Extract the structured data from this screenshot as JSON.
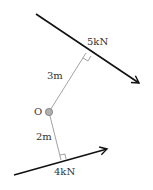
{
  "diagram": {
    "pivot": {
      "label": "O"
    },
    "forces": [
      {
        "id": "upper",
        "label": "5kN",
        "magnitude_kN": 5,
        "perpendicular_distance_label": "3m",
        "perpendicular_distance_m": 3
      },
      {
        "id": "lower",
        "label": "4kN",
        "magnitude_kN": 4,
        "perpendicular_distance_label": "2m",
        "perpendicular_distance_m": 2
      }
    ],
    "colors": {
      "force_line": "#111111",
      "distance_line": "#8a8a8a",
      "pivot_fill": "#b0b0b0",
      "pivot_stroke": "#777777",
      "text": "#333333"
    }
  }
}
